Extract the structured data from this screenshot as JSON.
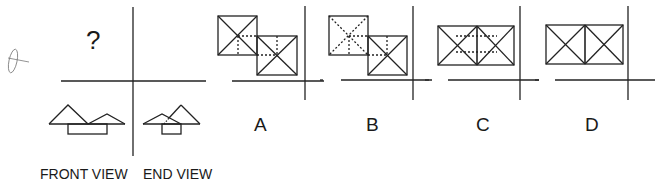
{
  "question": {
    "mark": "?",
    "views": [
      {
        "label": "FRONT VIEW"
      },
      {
        "label": "END VIEW"
      }
    ]
  },
  "options": [
    {
      "label": "A"
    },
    {
      "label": "B"
    },
    {
      "label": "C"
    },
    {
      "label": "D"
    }
  ],
  "colors": {
    "line": "#222222",
    "background": "#ffffff"
  }
}
